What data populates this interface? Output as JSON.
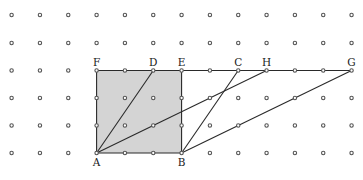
{
  "grid": {
    "cols": 13,
    "rows": 6,
    "x0": 11.6,
    "dx": 28.33,
    "ys": [
      15,
      43,
      70.5,
      98,
      125.5,
      153
    ]
  },
  "colors": {
    "shade": "#d4d4d4",
    "line": "#2a2a2a",
    "dot": "#555555"
  },
  "points": {
    "A": {
      "col": 3,
      "row": 5,
      "label": "A",
      "label_pos": "below"
    },
    "B": {
      "col": 6,
      "row": 5,
      "label": "B",
      "label_pos": "below"
    },
    "F": {
      "col": 3,
      "row": 2,
      "label": "F",
      "label_pos": "above"
    },
    "D": {
      "col": 5,
      "row": 2,
      "label": "D",
      "label_pos": "above"
    },
    "E": {
      "col": 6,
      "row": 2,
      "label": "E",
      "label_pos": "above"
    },
    "C": {
      "col": 8,
      "row": 2,
      "label": "C",
      "label_pos": "above"
    },
    "H": {
      "col": 9,
      "row": 2,
      "label": "H",
      "label_pos": "above"
    },
    "G": {
      "col": 12,
      "row": 2,
      "label": "G",
      "label_pos": "above"
    }
  },
  "shaded_square": [
    "F",
    "E",
    "B",
    "A"
  ],
  "segments": [
    [
      "F",
      "G"
    ],
    [
      "A",
      "D"
    ],
    [
      "A",
      "H"
    ],
    [
      "B",
      "C"
    ],
    [
      "B",
      "G"
    ]
  ]
}
